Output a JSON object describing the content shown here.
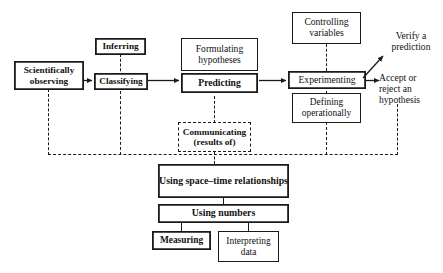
{
  "diagram": {
    "colors": {
      "stroke": "#1a1a1a",
      "text": "#111111",
      "background": "#ffffff"
    },
    "nodes": {
      "scientifically_observing": {
        "label": "Scientifically\nobserving",
        "style": "double-bold"
      },
      "inferring": {
        "label": "Inferring",
        "style": "double-bold"
      },
      "classifying": {
        "label": "Classifying",
        "style": "double-bold"
      },
      "formulating_hypotheses": {
        "label": "Formulating\nhypotheses",
        "style": "single"
      },
      "predicting": {
        "label": "Predicting",
        "style": "double-bold"
      },
      "communicating": {
        "label": "Communicating\n(results of)",
        "style": "dashed-bold"
      },
      "controlling_variables": {
        "label": "Controlling\nvariables",
        "style": "single"
      },
      "experimenting": {
        "label": "Experimenting",
        "style": "double"
      },
      "defining_operationally": {
        "label": "Defining\noperationally",
        "style": "single"
      },
      "using_space_time": {
        "label": "Using space–time\nrelationships",
        "style": "double-bold"
      },
      "using_numbers": {
        "label": "Using numbers",
        "style": "double-bold"
      },
      "measuring": {
        "label": "Measuring",
        "style": "double-bold"
      },
      "interpreting_data": {
        "label": "Interpreting\ndata",
        "style": "single"
      }
    },
    "free_labels": {
      "verify_prediction": "Verify a\nprediction",
      "accept_or_reject": "Accept or\nreject an\nhypothesis"
    }
  }
}
